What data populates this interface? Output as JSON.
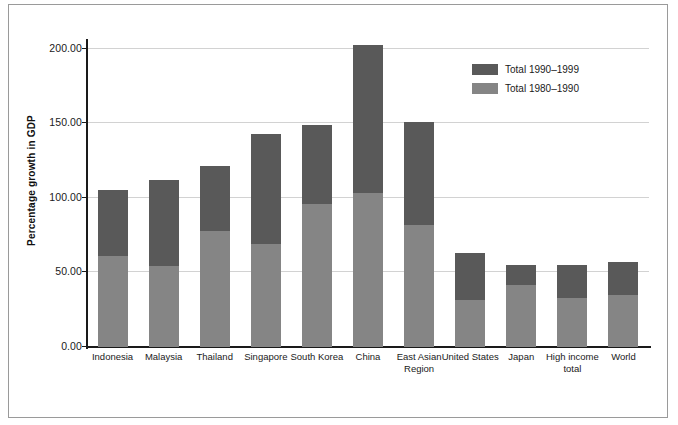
{
  "chart_data": {
    "type": "bar",
    "stacked": true,
    "title": "",
    "xlabel": "",
    "ylabel": "Percentage growth in GDP",
    "ylim": [
      0,
      200
    ],
    "yticks": [
      "0.00",
      "50.00",
      "100.00",
      "150.00",
      "200.00"
    ],
    "ytick_values": [
      0,
      50,
      100,
      150,
      200
    ],
    "grid": true,
    "legend_position": "top-right",
    "categories": [
      "Indonesia",
      "Malaysia",
      "Thailand",
      "Singapore",
      "South Korea",
      "China",
      "East Asian Region",
      "United States",
      "Japan",
      "High income total",
      "World"
    ],
    "series": [
      {
        "name": "Total 1980–1990",
        "color": "#858585",
        "values": [
          60,
          53,
          76,
          68,
          94,
          101,
          80,
          31,
          41,
          32,
          34
        ]
      },
      {
        "name": "Total 1990–1999",
        "color": "#595959",
        "values": [
          43,
          57,
          43,
          72,
          52,
          98,
          68,
          31,
          13,
          22,
          22
        ]
      }
    ],
    "totals": [
      103,
      110,
      119,
      140,
      146,
      199,
      148,
      62,
      54,
      54,
      56
    ]
  },
  "legend": {
    "entries": [
      {
        "label": "Total 1990–1999",
        "color": "#595959"
      },
      {
        "label": "Total 1980–1990",
        "color": "#858585"
      }
    ]
  },
  "axis": {
    "y_title": "Percentage growth in GDP"
  }
}
